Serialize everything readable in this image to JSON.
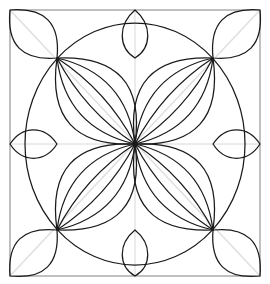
{
  "figure": {
    "kind": "geometric-line-art",
    "background_color": "#ffffff",
    "canvas": {
      "width": 270,
      "height": 284
    }
  },
  "style": {
    "main_stroke_color": "#1a1a1a",
    "main_stroke_width": 1.25,
    "frame_stroke_color": "#8c8c8c",
    "frame_stroke_width": 1.1,
    "guide_stroke_color": "#d8d8d8",
    "guide_stroke_width": 1.0,
    "diagonal_guide_color": "#e0e0e0",
    "diagonal_guide_width": 1.6,
    "fill": "none"
  },
  "geometry": {
    "frame": {
      "label": "outer square frame",
      "left": 10,
      "top": 10,
      "right": 260,
      "bottom": 276,
      "width": 250,
      "height": 266
    },
    "center": {
      "label": "center node",
      "x": 135,
      "y": 144
    },
    "nodes": [
      {
        "label": "node-top-left",
        "x": 57,
        "y": 58
      },
      {
        "label": "node-top-right",
        "x": 213,
        "y": 58
      },
      {
        "label": "node-bottom-right",
        "x": 213,
        "y": 230
      },
      {
        "label": "node-bottom-left",
        "x": 57,
        "y": 230
      }
    ],
    "corners": [
      {
        "label": "corner-top-left",
        "x": 10,
        "y": 10
      },
      {
        "label": "corner-top-right",
        "x": 260,
        "y": 10
      },
      {
        "label": "corner-bottom-right",
        "x": 260,
        "y": 276
      },
      {
        "label": "corner-bottom-left",
        "x": 10,
        "y": 276
      }
    ],
    "guides": {
      "vertical_axis_x": 135,
      "horizontal_axis_y": 144,
      "diagonals": true
    },
    "main_circle": {
      "label": "great circle through the four nodes",
      "cx": 135,
      "cy": 144,
      "rx": 110,
      "ry": 121
    }
  },
  "elements": {
    "quadrant_petals": {
      "label": "nested petals from each node to the center",
      "count_per_quadrant": 3,
      "quadrants": 4,
      "bulge_factors": [
        0.3,
        0.175,
        0.065
      ]
    },
    "corner_petals": {
      "label": "pointed leaf at each square corner",
      "count": 4,
      "bulge_factor": 0.3
    },
    "edge_petals": {
      "top": {
        "label": "top edge petal",
        "tip_x": 135,
        "tip_top_y": 10,
        "tip_bottom_y": 58,
        "half_width": 17
      },
      "bottom": {
        "label": "bottom edge petal",
        "tip_x": 135,
        "tip_top_y": 230,
        "tip_bottom_y": 276,
        "half_width": 17
      },
      "left": {
        "label": "left edge lens",
        "tip_inner_x": 57,
        "tip_outer_x": 10,
        "y": 144,
        "half_height": 19
      },
      "right": {
        "label": "right edge lens",
        "tip_inner_x": 213,
        "tip_outer_x": 260,
        "y": 144,
        "half_height": 19
      }
    }
  }
}
